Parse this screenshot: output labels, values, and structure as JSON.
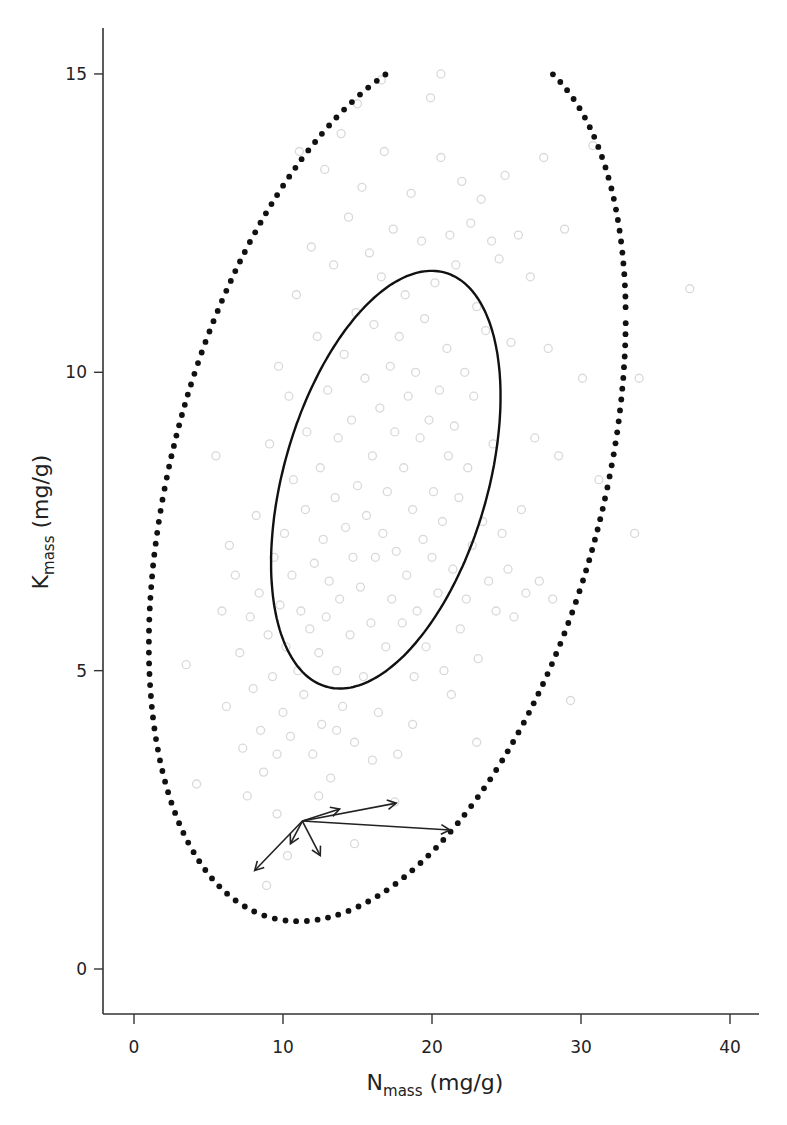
{
  "chart_data": {
    "type": "scatter",
    "title": "",
    "xlabel": {
      "main": "N",
      "sub": "mass",
      "unit": " (mg/g)"
    },
    "ylabel": {
      "main": "K",
      "sub": "mass",
      "unit": " (mg/g)"
    },
    "xlim": [
      -2.1,
      42
    ],
    "ylim": [
      -0.75,
      15.8
    ],
    "xticks": [
      0,
      10,
      20,
      30,
      40
    ],
    "yticks": [
      0,
      5,
      10,
      15
    ],
    "xtick_labels": [
      "0",
      "10",
      "20",
      "30",
      "40"
    ],
    "ytick_labels": [
      "0",
      "5",
      "10",
      "15"
    ],
    "grid": false,
    "legend": "none",
    "colors": {
      "axis": "#333333",
      "points": "#d9d9d9",
      "ellipse": "#111111",
      "arrows": "#222222"
    },
    "inner_ellipse": {
      "style": "solid",
      "center": [
        16.9,
        8.2
      ],
      "n_amp": 7.7,
      "k_amp": 3.5,
      "phase": 1.16
    },
    "outer_ellipse": {
      "style": "dotted",
      "center": [
        17.0,
        8.17
      ],
      "n_amp": 16.0,
      "k_amp": 7.37,
      "phase": 1.19,
      "clip_k_max": 15.0
    },
    "arrows": {
      "origin": [
        11.3,
        2.48
      ],
      "tips": [
        [
          13.8,
          2.68
        ],
        [
          17.6,
          2.78
        ],
        [
          21.2,
          2.33
        ],
        [
          12.5,
          1.9
        ],
        [
          10.5,
          2.1
        ],
        [
          8.1,
          1.65
        ]
      ]
    },
    "points": [
      [
        3.5,
        5.1
      ],
      [
        4.2,
        3.1
      ],
      [
        5.5,
        8.6
      ],
      [
        5.9,
        6.0
      ],
      [
        6.2,
        4.4
      ],
      [
        6.4,
        7.1
      ],
      [
        6.8,
        6.6
      ],
      [
        7.1,
        5.3
      ],
      [
        7.3,
        3.7
      ],
      [
        7.6,
        2.9
      ],
      [
        7.8,
        5.9
      ],
      [
        8.0,
        4.7
      ],
      [
        8.2,
        7.6
      ],
      [
        8.4,
        6.3
      ],
      [
        8.5,
        4.0
      ],
      [
        8.7,
        3.3
      ],
      [
        8.9,
        1.4
      ],
      [
        9.0,
        5.6
      ],
      [
        9.1,
        8.8
      ],
      [
        9.3,
        4.9
      ],
      [
        9.4,
        6.9
      ],
      [
        9.6,
        3.6
      ],
      [
        9.7,
        10.1
      ],
      [
        9.8,
        6.1
      ],
      [
        10.0,
        4.3
      ],
      [
        10.1,
        7.3
      ],
      [
        10.2,
        5.4
      ],
      [
        10.4,
        9.6
      ],
      [
        10.5,
        3.9
      ],
      [
        10.6,
        6.6
      ],
      [
        10.7,
        8.2
      ],
      [
        10.9,
        11.3
      ],
      [
        11.0,
        5.0
      ],
      [
        11.1,
        13.7
      ],
      [
        11.2,
        6.0
      ],
      [
        11.4,
        4.6
      ],
      [
        11.5,
        7.7
      ],
      [
        11.6,
        9.0
      ],
      [
        11.8,
        5.7
      ],
      [
        11.9,
        12.1
      ],
      [
        12.0,
        3.6
      ],
      [
        12.1,
        6.8
      ],
      [
        12.3,
        10.6
      ],
      [
        12.4,
        5.3
      ],
      [
        12.5,
        8.4
      ],
      [
        12.6,
        4.1
      ],
      [
        12.7,
        7.2
      ],
      [
        12.8,
        13.4
      ],
      [
        12.9,
        5.9
      ],
      [
        13.0,
        9.7
      ],
      [
        13.1,
        6.5
      ],
      [
        13.2,
        3.2
      ],
      [
        13.4,
        11.8
      ],
      [
        13.5,
        7.9
      ],
      [
        13.6,
        5.0
      ],
      [
        13.7,
        8.9
      ],
      [
        13.8,
        6.2
      ],
      [
        13.9,
        14.0
      ],
      [
        14.0,
        4.4
      ],
      [
        14.1,
        10.3
      ],
      [
        14.2,
        7.4
      ],
      [
        14.4,
        12.6
      ],
      [
        14.5,
        5.6
      ],
      [
        14.6,
        9.2
      ],
      [
        14.7,
        6.9
      ],
      [
        14.8,
        3.8
      ],
      [
        14.9,
        11.0
      ],
      [
        15.0,
        8.1
      ],
      [
        15.2,
        6.4
      ],
      [
        15.3,
        13.1
      ],
      [
        15.4,
        4.9
      ],
      [
        15.5,
        9.9
      ],
      [
        15.6,
        7.6
      ],
      [
        15.8,
        12.0
      ],
      [
        15.9,
        5.8
      ],
      [
        16.0,
        8.6
      ],
      [
        16.1,
        10.8
      ],
      [
        16.2,
        6.9
      ],
      [
        16.4,
        4.3
      ],
      [
        16.5,
        9.4
      ],
      [
        16.6,
        11.6
      ],
      [
        16.7,
        7.3
      ],
      [
        16.8,
        13.7
      ],
      [
        16.9,
        5.4
      ],
      [
        17.0,
        8.0
      ],
      [
        17.2,
        10.1
      ],
      [
        17.3,
        6.2
      ],
      [
        17.4,
        12.4
      ],
      [
        17.5,
        9.0
      ],
      [
        17.6,
        7.0
      ],
      [
        17.7,
        3.6
      ],
      [
        17.8,
        10.6
      ],
      [
        18.0,
        5.8
      ],
      [
        18.1,
        8.4
      ],
      [
        18.2,
        11.3
      ],
      [
        18.3,
        6.6
      ],
      [
        18.4,
        9.6
      ],
      [
        18.6,
        13.0
      ],
      [
        18.7,
        7.7
      ],
      [
        18.8,
        4.9
      ],
      [
        18.9,
        10.0
      ],
      [
        19.0,
        6.0
      ],
      [
        19.2,
        8.9
      ],
      [
        19.3,
        12.2
      ],
      [
        19.4,
        7.2
      ],
      [
        19.5,
        10.9
      ],
      [
        19.6,
        5.4
      ],
      [
        19.8,
        9.2
      ],
      [
        19.9,
        14.6
      ],
      [
        20.0,
        6.9
      ],
      [
        20.1,
        8.0
      ],
      [
        20.2,
        11.5
      ],
      [
        20.4,
        6.3
      ],
      [
        20.5,
        9.7
      ],
      [
        20.6,
        13.6
      ],
      [
        20.7,
        7.5
      ],
      [
        20.8,
        5.0
      ],
      [
        21.0,
        10.4
      ],
      [
        21.1,
        8.6
      ],
      [
        21.2,
        12.3
      ],
      [
        21.4,
        6.7
      ],
      [
        21.5,
        9.1
      ],
      [
        21.6,
        11.8
      ],
      [
        21.8,
        7.9
      ],
      [
        21.9,
        5.7
      ],
      [
        22.0,
        13.2
      ],
      [
        22.2,
        10.0
      ],
      [
        22.3,
        6.2
      ],
      [
        22.4,
        8.4
      ],
      [
        22.6,
        12.5
      ],
      [
        22.7,
        7.1
      ],
      [
        22.8,
        9.6
      ],
      [
        23.0,
        11.1
      ],
      [
        23.1,
        5.2
      ],
      [
        23.3,
        12.9
      ],
      [
        23.4,
        7.5
      ],
      [
        23.6,
        10.7
      ],
      [
        23.8,
        6.5
      ],
      [
        24.0,
        12.2
      ],
      [
        24.1,
        8.8
      ],
      [
        24.3,
        6.0
      ],
      [
        24.5,
        11.9
      ],
      [
        24.7,
        7.3
      ],
      [
        24.9,
        13.3
      ],
      [
        25.1,
        6.7
      ],
      [
        25.3,
        10.5
      ],
      [
        25.5,
        5.9
      ],
      [
        25.8,
        12.3
      ],
      [
        26.0,
        7.7
      ],
      [
        26.3,
        6.3
      ],
      [
        26.6,
        11.6
      ],
      [
        26.9,
        8.9
      ],
      [
        27.2,
        6.5
      ],
      [
        27.5,
        13.6
      ],
      [
        27.8,
        10.4
      ],
      [
        28.1,
        6.2
      ],
      [
        28.5,
        8.6
      ],
      [
        28.9,
        12.4
      ],
      [
        29.3,
        4.5
      ],
      [
        30.1,
        9.9
      ],
      [
        30.8,
        13.8
      ],
      [
        31.2,
        8.2
      ],
      [
        33.6,
        7.3
      ],
      [
        33.9,
        9.9
      ],
      [
        37.3,
        11.4
      ],
      [
        15.0,
        14.5
      ],
      [
        16.6,
        14.9
      ],
      [
        20.6,
        15.0
      ],
      [
        12.4,
        2.9
      ],
      [
        14.8,
        2.1
      ],
      [
        17.5,
        2.8
      ],
      [
        18.7,
        4.1
      ],
      [
        9.6,
        2.6
      ],
      [
        10.3,
        1.9
      ],
      [
        21.3,
        4.6
      ],
      [
        23.0,
        3.8
      ],
      [
        13.6,
        4.0
      ],
      [
        16.0,
        3.5
      ]
    ]
  }
}
